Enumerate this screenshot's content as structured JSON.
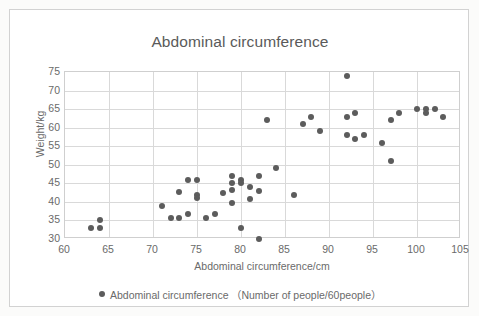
{
  "chart_data": {
    "type": "scatter",
    "title": "Abdominal circumference",
    "xlabel": "Abdominal circumference/cm",
    "ylabel": "Weight/kg",
    "xlim": [
      60,
      105
    ],
    "ylim": [
      30,
      75
    ],
    "xticks": [
      60,
      65,
      70,
      75,
      80,
      85,
      90,
      95,
      100,
      105
    ],
    "yticks": [
      30,
      35,
      40,
      45,
      50,
      55,
      60,
      65,
      70,
      75
    ],
    "grid": true,
    "legend_position": "bottom",
    "legend": [
      "Abdominal circumference （Number of people/60people）"
    ],
    "series": [
      {
        "name": "Abdominal circumference",
        "color": "#5c5c5c",
        "marker": "circle",
        "points": [
          [
            63,
            33
          ],
          [
            64,
            35
          ],
          [
            64,
            33
          ],
          [
            71,
            38.8
          ],
          [
            72,
            35.7
          ],
          [
            73,
            35.7
          ],
          [
            73,
            42.7
          ],
          [
            74,
            36.8
          ],
          [
            74,
            45.8
          ],
          [
            75,
            45.8
          ],
          [
            75,
            41.8
          ],
          [
            75,
            41
          ],
          [
            76,
            35.7
          ],
          [
            77,
            36.8
          ],
          [
            78,
            42.4
          ],
          [
            79,
            47
          ],
          [
            79,
            45
          ],
          [
            79,
            43.3
          ],
          [
            79,
            39.7
          ],
          [
            80,
            45.8
          ],
          [
            80,
            45
          ],
          [
            80,
            33
          ],
          [
            81,
            44
          ],
          [
            81,
            40.7
          ],
          [
            82,
            47
          ],
          [
            82,
            42.8
          ],
          [
            82,
            30
          ],
          [
            83,
            62
          ],
          [
            84,
            49
          ],
          [
            86,
            41.8
          ],
          [
            87,
            61
          ],
          [
            88,
            63
          ],
          [
            89,
            59
          ],
          [
            92,
            74
          ],
          [
            92,
            63
          ],
          [
            92,
            58
          ],
          [
            93,
            64
          ],
          [
            93,
            57
          ],
          [
            94,
            58
          ],
          [
            96,
            56
          ],
          [
            97,
            62
          ],
          [
            97,
            51
          ],
          [
            98,
            64
          ],
          [
            100,
            65
          ],
          [
            101,
            65
          ],
          [
            101,
            64
          ],
          [
            102,
            65
          ],
          [
            103,
            63
          ]
        ]
      }
    ]
  }
}
